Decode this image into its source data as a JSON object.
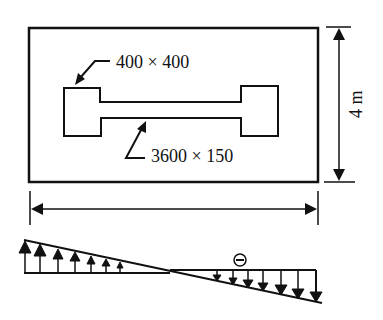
{
  "diagram": {
    "type": "raft foundation plan with soil pressure distribution",
    "plan": {
      "column_label": "400 × 400",
      "wall_label": "3600 × 150",
      "width_dimension_label": "",
      "height_dimension_label": "4 m"
    },
    "pressure_diagram": {
      "sign_label": "⊖",
      "left_arrows": "upward (compression)",
      "right_arrows": "downward (tension)",
      "left_arrow_count": 7,
      "right_arrow_count": 7
    },
    "colors": {
      "line": "#111111",
      "background": "#ffffff"
    }
  }
}
